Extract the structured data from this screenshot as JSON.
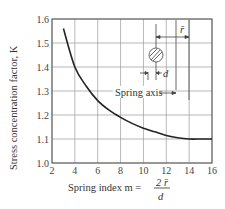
{
  "chart_data": {
    "type": "line",
    "title": "",
    "xlabel": "Spring index m = 2r̄/d",
    "ylabel": "Stress concentration factor, K",
    "xlim": [
      2,
      16
    ],
    "ylim": [
      1.0,
      1.6
    ],
    "x_ticks": [
      2,
      4,
      6,
      8,
      10,
      12,
      14,
      16
    ],
    "y_ticks": [
      1.0,
      1.1,
      1.2,
      1.3,
      1.4,
      1.5,
      1.6
    ],
    "grid": true,
    "series": [
      {
        "name": "K",
        "x": [
          3,
          4,
          5,
          6,
          7,
          8,
          9,
          10,
          11,
          12,
          13,
          14,
          15,
          16
        ],
        "y": [
          1.56,
          1.4,
          1.32,
          1.26,
          1.22,
          1.19,
          1.165,
          1.145,
          1.13,
          1.115,
          1.105,
          1.1,
          1.1,
          1.1
        ]
      }
    ],
    "annotations": [
      "r̄",
      "d",
      "Spring axis"
    ]
  },
  "labels": {
    "ylabel": "Stress concentration factor, K",
    "xlabel_prefix": "Spring index m =",
    "frac_num": "2 r̄",
    "frac_den": "d",
    "spring_axis": "Spring axis",
    "r": "r̄",
    "d": "d"
  }
}
